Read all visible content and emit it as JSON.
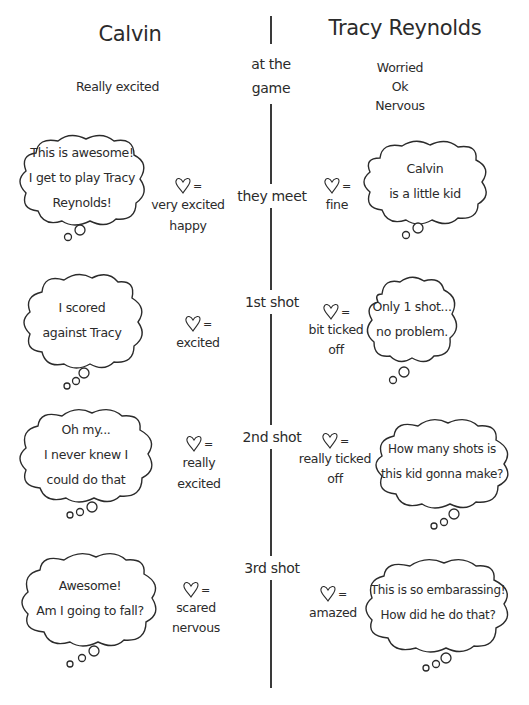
{
  "columns": {
    "left": "Calvin",
    "right": "Tracy Reynolds"
  },
  "stages": [
    {
      "label_lines": [
        "at the",
        "game"
      ],
      "calvin_feelings": [
        "Really excited"
      ],
      "tracy_feelings": [
        "Worried",
        "Ok",
        "Nervous"
      ]
    },
    {
      "label_lines": [
        "they meet"
      ],
      "calvin_thought": [
        "This is awesome!",
        "I get to play Tracy",
        "Reynolds!"
      ],
      "calvin_heart": [
        "very excited",
        "happy"
      ],
      "tracy_heart": [
        "fine"
      ],
      "tracy_thought": [
        "Calvin",
        "is a little kid"
      ]
    },
    {
      "label_lines": [
        "1st shot"
      ],
      "calvin_thought": [
        "I scored",
        "against Tracy"
      ],
      "calvin_heart": [
        "excited"
      ],
      "tracy_heart": [
        "bit ticked",
        "off"
      ],
      "tracy_thought": [
        "Only 1 shot...",
        "no problem."
      ]
    },
    {
      "label_lines": [
        "2nd shot"
      ],
      "calvin_thought": [
        "Oh my...",
        "I never knew I",
        "could do that"
      ],
      "calvin_heart": [
        "really",
        "excited"
      ],
      "tracy_heart": [
        "really ticked",
        "off"
      ],
      "tracy_thought": [
        "How many shots is",
        "this kid gonna make?"
      ]
    },
    {
      "label_lines": [
        "3rd shot"
      ],
      "calvin_thought": [
        "Awesome!",
        "Am I going to fall?"
      ],
      "calvin_heart": [
        "scared",
        "nervous"
      ],
      "tracy_heart": [
        "amazed"
      ],
      "tracy_thought": [
        "This is so embarassing!",
        "How did he do that?"
      ]
    }
  ],
  "symbols": {
    "heart_equals": "=",
    "heart_icon": "heart-outline-icon"
  },
  "colors": {
    "ink": "#2b2b2b",
    "background": "#ffffff"
  }
}
